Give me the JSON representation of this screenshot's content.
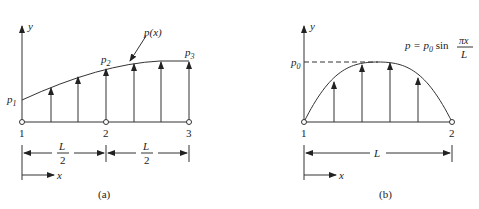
{
  "figures": [
    {
      "id": "a",
      "caption": "(a)",
      "y_axis_label": "y",
      "x_axis_label": "x",
      "curve_label": "p(x)",
      "load_labels": {
        "p1": "p",
        "p1_sub": "1",
        "p2": "p",
        "p2_sub": "2",
        "p3": "p",
        "p3_sub": "3"
      },
      "nodes": [
        "1",
        "2",
        "3"
      ],
      "dimensions": [
        {
          "num": "L",
          "den": "2"
        },
        {
          "num": "L",
          "den": "2"
        }
      ]
    },
    {
      "id": "b",
      "caption": "(b)",
      "y_axis_label": "y",
      "x_axis_label": "x",
      "peak_label": "p",
      "peak_sub": "0",
      "equation": {
        "lhs": "p = p",
        "sub": "0",
        "fn": " sin ",
        "num": "πx",
        "den": "L"
      },
      "nodes": [
        "1",
        "2"
      ],
      "dimension": "L"
    }
  ]
}
